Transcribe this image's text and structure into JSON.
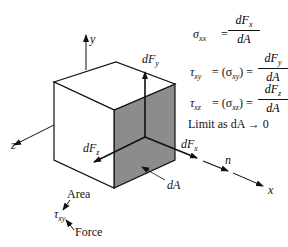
{
  "diagram": {
    "axes": {
      "x": "x",
      "y": "y",
      "z": "z",
      "n": "n"
    },
    "forces": {
      "dFx": "dF",
      "dFx_sub": "x",
      "dFy": "dF",
      "dFy_sub": "y",
      "dFz": "dF",
      "dFz_sub": "z"
    },
    "area_label": "dA",
    "legend": {
      "area": "Area",
      "symbol": "τ",
      "symbol_sub": "xy",
      "force": "Force"
    },
    "shaded_face_color": "#8c8c8c",
    "equations": [
      {
        "lhs": "σ",
        "lhs_sub": "xx",
        "mid": "=",
        "num": "dF",
        "num_sub": "x",
        "den": "dA"
      },
      {
        "lhs": "τ",
        "lhs_sub": "xy",
        "mid": "= (σ",
        "mid_sub": "xy",
        "mid_end": ") =",
        "num": "dF",
        "num_sub": "y",
        "den": "dA"
      },
      {
        "lhs": "τ",
        "lhs_sub": "xz",
        "mid": "= (σ",
        "mid_sub": "xz",
        "mid_end": ") =",
        "num": "dF",
        "num_sub": "z",
        "den": "dA"
      }
    ],
    "limit_text": "Limit as dA → 0"
  }
}
